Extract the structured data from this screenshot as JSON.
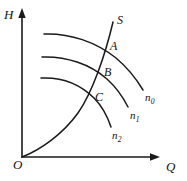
{
  "figure": {
    "kind": "line-chart",
    "background_color": "#ffffff",
    "ink_color": "#1a1a1a",
    "axes": {
      "y_label": "H",
      "x_label": "Q",
      "origin_label": "O",
      "y_label_pos": {
        "x": 4,
        "y": 8
      },
      "x_label_pos": {
        "x": 166,
        "y": 160
      },
      "origin_label_pos": {
        "x": 13,
        "y": 158
      }
    },
    "point_labels": [
      {
        "id": "S",
        "text": "S",
        "x": 117,
        "y": 14
      },
      {
        "id": "A",
        "text": "A",
        "x": 110,
        "y": 40
      },
      {
        "id": "B",
        "text": "B",
        "x": 104,
        "y": 66
      },
      {
        "id": "C",
        "text": "C",
        "x": 95,
        "y": 91
      }
    ],
    "curve_labels": [
      {
        "id": "n0",
        "base": "n",
        "sub": "0",
        "x": 145,
        "y": 92
      },
      {
        "id": "n1",
        "base": "n",
        "sub": "1",
        "x": 130,
        "y": 110
      },
      {
        "id": "n2",
        "base": "n",
        "sub": "2",
        "x": 112,
        "y": 130
      }
    ]
  },
  "chart_data": {
    "type": "line",
    "title": "",
    "subtitle": "",
    "xlabel": "Q",
    "ylabel": "H",
    "xlim": [
      0,
      187
    ],
    "ylim": [
      0,
      181
    ],
    "grid": false,
    "legend": "inline-curve-labels",
    "axis_style": "arrow-headed open axes (first quadrant only)",
    "series": [
      {
        "name": "n0",
        "label": "n₀",
        "role": "pump-head-curve-highest-speed",
        "path": "M 44,34 C 70,33 96,42 116,58 C 128,68 137,80 143,90",
        "points": [
          {
            "x": 44,
            "y": 34
          },
          {
            "x": 70,
            "y": 35
          },
          {
            "x": 92,
            "y": 44
          },
          {
            "x": 110,
            "y": 55
          },
          {
            "x": 126,
            "y": 69
          },
          {
            "x": 143,
            "y": 90
          }
        ]
      },
      {
        "name": "n1",
        "label": "n₁",
        "role": "pump-head-curve-mid-speed",
        "path": "M 42,57 C 66,56 90,64 107,79 C 118,89 124,99 128,107",
        "points": [
          {
            "x": 42,
            "y": 57
          },
          {
            "x": 64,
            "y": 58
          },
          {
            "x": 85,
            "y": 66
          },
          {
            "x": 102,
            "y": 77
          },
          {
            "x": 116,
            "y": 91
          },
          {
            "x": 128,
            "y": 107
          }
        ]
      },
      {
        "name": "n2",
        "label": "n₂",
        "role": "pump-head-curve-lowest-speed",
        "path": "M 41,78 C 61,77 80,84 94,98 C 103,107 108,118 111,127",
        "points": [
          {
            "x": 41,
            "y": 78
          },
          {
            "x": 60,
            "y": 79
          },
          {
            "x": 76,
            "y": 86
          },
          {
            "x": 90,
            "y": 96
          },
          {
            "x": 102,
            "y": 110
          },
          {
            "x": 111,
            "y": 127
          }
        ]
      },
      {
        "name": "S",
        "label": "S",
        "role": "system-resistance-curve",
        "path": "M 22,157 C 40,150 62,135 78,113 C 92,93 105,56 113,22",
        "points": [
          {
            "x": 22,
            "y": 157
          },
          {
            "x": 42,
            "y": 148
          },
          {
            "x": 62,
            "y": 132
          },
          {
            "x": 78,
            "y": 113
          },
          {
            "x": 90,
            "y": 90
          },
          {
            "x": 102,
            "y": 58
          },
          {
            "x": 113,
            "y": 22
          }
        ]
      }
    ],
    "annotations": [
      {
        "text": "S",
        "type": "curve-name",
        "x": 117,
        "y": 20
      },
      {
        "text": "A",
        "type": "operating-point",
        "x": 110,
        "y": 46,
        "marker_x": 104,
        "marker_y": 50
      },
      {
        "text": "B",
        "type": "operating-point",
        "x": 104,
        "y": 72,
        "marker_x": 96,
        "marker_y": 75
      },
      {
        "text": "C",
        "type": "operating-point",
        "x": 95,
        "y": 97,
        "marker_x": 87,
        "marker_y": 97
      }
    ]
  }
}
